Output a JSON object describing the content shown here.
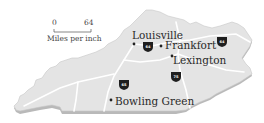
{
  "map": {
    "type": "state-map",
    "region": "Kentucky",
    "colors": {
      "land": "#e4e4e4",
      "land_shadow": "#b9b9b9",
      "highway": "#ffffff",
      "shield": "#1e1e1e",
      "city_dot": "#222222",
      "text": "#2a2a2a"
    },
    "scale": {
      "start_label": "0",
      "end_label": "64",
      "caption": "Miles per inch"
    },
    "cities": [
      {
        "name": "Louisville"
      },
      {
        "name": "Frankfort"
      },
      {
        "name": "Lexington"
      },
      {
        "name": "Bowling Green"
      }
    ],
    "interstates": [
      {
        "number": "64",
        "location": "between Louisville and Frankfort"
      },
      {
        "number": "64",
        "location": "eastern Kentucky"
      },
      {
        "number": "65",
        "location": "north of Bowling Green"
      },
      {
        "number": "75",
        "location": "south of Lexington"
      }
    ]
  }
}
